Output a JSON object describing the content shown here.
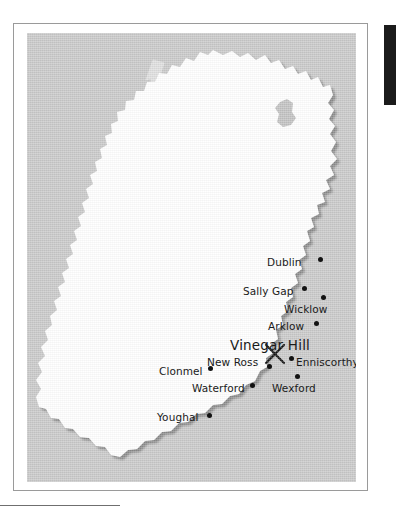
{
  "page": {
    "background_color": "#ffffff",
    "sea_color": "#c9c9c9",
    "land_color": "#ffffff",
    "shadow_color": "#8f8f8f",
    "label_color": "#1a1a1a",
    "black_tab_color": "#1b1b1b"
  },
  "map": {
    "region_name": "Ireland",
    "highlight": {
      "label": "Vinegar Hill",
      "marker": "crossed-pikes-x-marker"
    },
    "watermark": {
      "name": "crossed-pikes-watermark",
      "color": "#e3e3e3"
    },
    "lake": {
      "name": "lough-neagh",
      "color": "#c0c0c0"
    },
    "cities": [
      {
        "name": "Dublin",
        "label": "Dublin",
        "label_x": 240,
        "label_y": 224,
        "dot_x": 291,
        "dot_y": 224,
        "size": "normal",
        "anchor": "left"
      },
      {
        "name": "Sally Gap",
        "label": "Sally Gap",
        "label_x": 216,
        "label_y": 253,
        "dot_x": 275,
        "dot_y": 253,
        "size": "normal",
        "anchor": "left"
      },
      {
        "name": "Wicklow",
        "label": "Wicklow",
        "label_x": 257,
        "label_y": 271,
        "dot_x": 294,
        "dot_y": 262,
        "size": "normal",
        "anchor": "left"
      },
      {
        "name": "Arklow",
        "label": "Arklow",
        "label_x": 241,
        "label_y": 288,
        "dot_x": 287,
        "dot_y": 288,
        "size": "normal",
        "anchor": "left"
      },
      {
        "name": "Vinegar Hill",
        "label": "Vinegar Hill",
        "label_x": 203,
        "label_y": 306,
        "dot_x": null,
        "dot_y": null,
        "size": "big",
        "anchor": "left"
      },
      {
        "name": "New Ross",
        "label": "New Ross",
        "label_x": 180,
        "label_y": 324,
        "dot_x": 240,
        "dot_y": 331,
        "size": "normal",
        "anchor": "left"
      },
      {
        "name": "Enniscorthy",
        "label": "Enniscorthy",
        "label_x": 269,
        "label_y": 324,
        "dot_x": 262,
        "dot_y": 323,
        "size": "normal",
        "anchor": "left"
      },
      {
        "name": "Clonmel",
        "label": "Clonmel",
        "label_x": 132,
        "label_y": 333,
        "dot_x": 181,
        "dot_y": 333,
        "size": "normal",
        "anchor": "left"
      },
      {
        "name": "Waterford",
        "label": "Waterford",
        "label_x": 165,
        "label_y": 350,
        "dot_x": 223,
        "dot_y": 350,
        "size": "normal",
        "anchor": "left"
      },
      {
        "name": "Wexford",
        "label": "Wexford",
        "label_x": 245,
        "label_y": 350,
        "dot_x": 268,
        "dot_y": 341,
        "size": "normal",
        "anchor": "left"
      },
      {
        "name": "Youghal",
        "label": "Youghal",
        "label_x": 130,
        "label_y": 379,
        "dot_x": 180,
        "dot_y": 380,
        "size": "normal",
        "anchor": "left"
      }
    ]
  }
}
